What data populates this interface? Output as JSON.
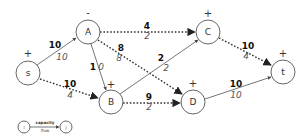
{
  "diagram": {
    "title": "",
    "nodes": [
      {
        "id": "s",
        "label": "s",
        "sign": "+",
        "x": 28,
        "y": 73
      },
      {
        "id": "A",
        "label": "A",
        "sign": "-",
        "x": 88,
        "y": 32
      },
      {
        "id": "B",
        "label": "B",
        "sign": "+",
        "x": 111,
        "y": 102
      },
      {
        "id": "C",
        "label": "C",
        "sign": "+",
        "x": 208,
        "y": 32
      },
      {
        "id": "D",
        "label": "D",
        "sign": "+",
        "x": 193,
        "y": 102
      },
      {
        "id": "t",
        "label": "t",
        "sign": "+",
        "x": 283,
        "y": 72
      }
    ],
    "edges": [
      {
        "from": "s",
        "to": "A",
        "capacity": "10",
        "flow": "10",
        "style": "solid"
      },
      {
        "from": "s",
        "to": "B",
        "capacity": "10",
        "flow": "4",
        "style": "dotted"
      },
      {
        "from": "A",
        "to": "C",
        "capacity": "4",
        "flow": "2",
        "style": "dotted"
      },
      {
        "from": "A",
        "to": "D",
        "capacity": "8",
        "flow": "8",
        "style": "dotted"
      },
      {
        "from": "A",
        "to": "B",
        "capacity": "1",
        "flow": "0",
        "style": "solid"
      },
      {
        "from": "B",
        "to": "C",
        "capacity": "2",
        "flow": "2",
        "style": "solid"
      },
      {
        "from": "B",
        "to": "D",
        "capacity": "9",
        "flow": "2",
        "style": "dotted"
      },
      {
        "from": "C",
        "to": "t",
        "capacity": "10",
        "flow": "4",
        "style": "dotted"
      },
      {
        "from": "D",
        "to": "t",
        "capacity": "10",
        "flow": "10",
        "style": "solid"
      }
    ],
    "legend": {
      "from_label": "i",
      "to_label": "j",
      "capacity_label": "capacity",
      "flow_label": "flow"
    }
  }
}
